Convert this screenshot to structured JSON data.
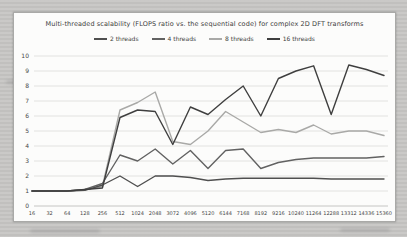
{
  "chart_data": {
    "type": "line",
    "title": "Multi-threaded scalability (FLOPS ratio vs. the sequential code) for complex 2D DFT transforms",
    "xlabel": "",
    "ylabel": "",
    "ylim": [
      0,
      10
    ],
    "y_ticks": [
      "0",
      "1",
      "2",
      "3",
      "4",
      "5",
      "6",
      "7",
      "8",
      "9",
      "10"
    ],
    "grid": true,
    "legend_position": "top",
    "categories": [
      "16",
      "32",
      "64",
      "128",
      "256",
      "512",
      "1024",
      "2048",
      "3072",
      "4096",
      "5120",
      "6144",
      "7168",
      "8192",
      "9216",
      "10240",
      "11264",
      "12288",
      "13312",
      "14336",
      "15360"
    ],
    "series": [
      {
        "name": "2 threads",
        "color": "#4f4f4f",
        "values": [
          1.0,
          1.0,
          1.0,
          1.05,
          1.4,
          2.0,
          1.3,
          2.0,
          2.0,
          1.9,
          1.7,
          1.8,
          1.85,
          1.85,
          1.85,
          1.85,
          1.85,
          1.8,
          1.8,
          1.8,
          1.8
        ]
      },
      {
        "name": "4 threads",
        "color": "#626262",
        "values": [
          1.0,
          1.0,
          1.0,
          1.1,
          1.5,
          3.4,
          3.0,
          3.8,
          2.8,
          3.7,
          2.5,
          3.7,
          3.8,
          2.5,
          2.9,
          3.1,
          3.2,
          3.2,
          3.2,
          3.2,
          3.3
        ]
      },
      {
        "name": "8 threads",
        "color": "#a9a9a7",
        "values": [
          1.0,
          1.0,
          1.0,
          1.1,
          1.3,
          6.4,
          6.9,
          7.6,
          4.3,
          4.1,
          5.0,
          6.3,
          5.6,
          4.9,
          5.1,
          4.9,
          5.4,
          4.8,
          5.0,
          5.0,
          4.7
        ]
      },
      {
        "name": "16 threads",
        "color": "#3f3f3f",
        "values": [
          1.0,
          1.0,
          1.0,
          1.1,
          1.2,
          5.9,
          6.4,
          6.3,
          4.1,
          6.6,
          6.1,
          7.1,
          8.0,
          6.0,
          8.5,
          9.0,
          9.35,
          6.1,
          9.4,
          9.1,
          8.7
        ]
      }
    ]
  }
}
